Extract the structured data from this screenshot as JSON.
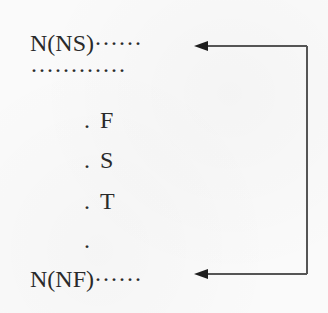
{
  "diagram": {
    "lines": [
      {
        "id": "start",
        "label": "N(NS)",
        "trail": "······"
      },
      {
        "id": "ellipsis",
        "label": "",
        "trail": "············"
      },
      {
        "id": "f",
        "prefix": ".",
        "label": "F"
      },
      {
        "id": "s",
        "prefix": ".",
        "label": "S"
      },
      {
        "id": "t",
        "prefix": ".",
        "label": "T"
      },
      {
        "id": "dot",
        "prefix": ".",
        "label": ""
      },
      {
        "id": "end",
        "label": "N(NF)",
        "trail": "······"
      }
    ],
    "loop_arrow": {
      "from": "right-side",
      "targets": [
        "N(NS)",
        "N(NF)"
      ],
      "color": "#555555"
    }
  }
}
